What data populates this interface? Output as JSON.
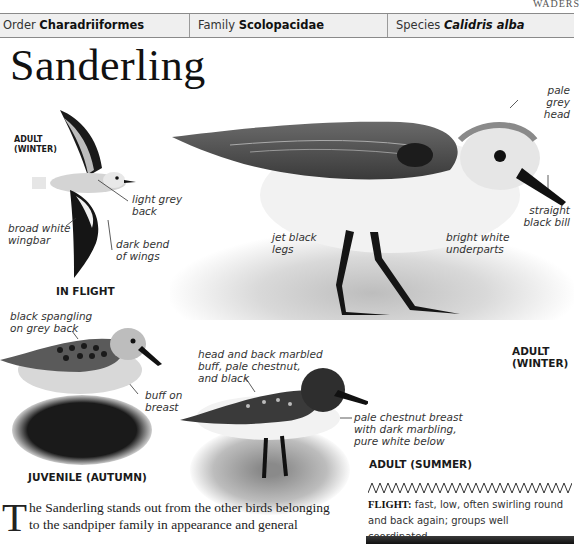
{
  "header": {
    "section_tag": "WADERS",
    "order_label": "Order",
    "order_value": "Charadriiformes",
    "family_label": "Family",
    "family_value": "Scolopacidae",
    "species_label": "Species",
    "species_value": "Calidris alba"
  },
  "title": "Sanderling",
  "flight_illustration": {
    "caption": "IN FLIGHT",
    "age_label_line1": "ADULT",
    "age_label_line2": "(WINTER)",
    "labels": [
      {
        "line1": "light grey",
        "line2": "back"
      },
      {
        "line1": "broad white",
        "line2": "wingbar"
      },
      {
        "line1": "dark bend",
        "line2": "of wings"
      }
    ]
  },
  "main_photo": {
    "caption_line1": "ADULT",
    "caption_line2": "(WINTER)",
    "labels": [
      {
        "line1": "pale grey",
        "line2": "head"
      },
      {
        "line1": "straight",
        "line2": "black bill"
      },
      {
        "line1": "jet black",
        "line2": "legs"
      },
      {
        "line1": "bright white",
        "line2": "underparts"
      }
    ]
  },
  "juvenile_photo": {
    "caption": "JUVENILE (AUTUMN)",
    "labels": [
      {
        "line1": "black spangling",
        "line2": "on grey back"
      },
      {
        "line1": "buff on",
        "line2": "breast"
      }
    ]
  },
  "summer_photo": {
    "caption": "ADULT (SUMMER)",
    "labels": [
      {
        "line1": "head and back marbled",
        "line2": "buff, pale chestnut,",
        "line3": "and black"
      },
      {
        "line1": "pale chestnut breast",
        "line2": "with dark marbling,",
        "line3": "pure white below"
      }
    ]
  },
  "flight_info": {
    "label": "FLIGHT:",
    "text": " fast, low, often swirling round and back again; groups well coordinated."
  },
  "body": {
    "dropcap": "T",
    "text": "he Sanderling stands out from the other birds belonging to the sandpiper family in appearance and general"
  },
  "colors": {
    "header_bg": "#efefef",
    "header_border": "#8a8a8a",
    "text": "#1a1a1a"
  }
}
